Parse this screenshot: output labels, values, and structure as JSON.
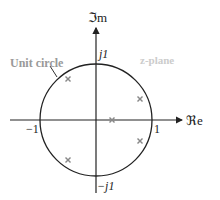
{
  "diagram": {
    "title": "z-plane",
    "unit_circle_label": "Unit circle",
    "axes": {
      "imag_label": "ℑm",
      "real_label": "ℜe"
    },
    "ticks": {
      "j1": "j1",
      "neg_j1": "−j1",
      "neg_one": "−1",
      "one": "1"
    },
    "colors": {
      "line": "#222222",
      "marker": "#888888",
      "label_gray": "#999999",
      "plane_label": "#cccccc"
    },
    "poles": [
      {
        "re": -0.5,
        "im": 0.73
      },
      {
        "re": -0.5,
        "im": -0.73
      },
      {
        "re": 0.29,
        "im": 0.0
      },
      {
        "re": 0.79,
        "im": 0.37
      },
      {
        "re": 0.79,
        "im": -0.37
      }
    ]
  }
}
